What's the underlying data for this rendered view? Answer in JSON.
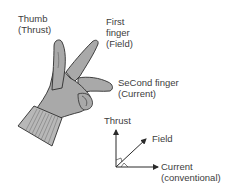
{
  "diagram": {
    "hand_labels": {
      "thumb": {
        "line1": "Thumb",
        "line2": "(Thrust)"
      },
      "first_finger": {
        "line1": "First",
        "line2": "finger",
        "line3": "(Field)"
      },
      "second_finger": {
        "line1": "SeCond finger",
        "line2": "(Current)"
      }
    },
    "axes": {
      "thrust": "Thrust",
      "field": "Field",
      "current": {
        "line1": "Current",
        "line2": "(conventional)"
      }
    },
    "colors": {
      "hand_fill": "#a9a9a9",
      "hand_outline": "#2e2e2e",
      "cuff_fill": "#b8b8b8",
      "axis_line": "#2a2a2a",
      "text": "#3d3d3d"
    }
  }
}
